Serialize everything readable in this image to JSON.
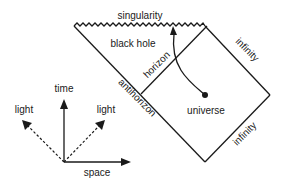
{
  "diagram": {
    "type": "penrose-diagram",
    "colors": {
      "ink": "#1a1a1a",
      "background": "#ffffff"
    },
    "regions": {
      "black_hole": "black hole",
      "universe": "universe"
    },
    "boundaries": {
      "singularity": "singularity",
      "horizon": "horizon",
      "antihorizon": "antihorizon",
      "infinity_upper": "infinity",
      "infinity_lower": "infinity"
    },
    "axes": {
      "time": "time",
      "space": "space",
      "light_left": "light",
      "light_right": "light"
    },
    "geometry": {
      "singularity_start": [
        74,
        26
      ],
      "singularity_end": [
        205,
        26
      ],
      "right_vertex": [
        270,
        95
      ],
      "bottom_vertex": [
        205,
        162
      ],
      "horizon_bottom": [
        141,
        94
      ],
      "worldline_start": [
        205,
        95
      ],
      "worldline_end": [
        173,
        28
      ],
      "axes_origin": [
        64,
        162
      ]
    }
  }
}
